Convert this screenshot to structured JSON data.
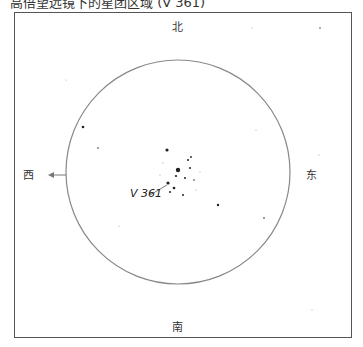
{
  "caption": {
    "text": "高倍望远镜下的星团区域 (V 361)",
    "visible": "partially cut off at top edge"
  },
  "chart": {
    "directions": {
      "north": "北",
      "south": "南",
      "east": "东",
      "west": "西"
    },
    "target_label": "V 361",
    "field_circle": {
      "cx": 178,
      "cy": 172,
      "r": 112,
      "color": "#888888"
    },
    "arrow_direction": "west",
    "colors": {
      "frame": "#555555",
      "star": "#222222",
      "text": "#333333"
    },
    "stars": [
      {
        "x": 167,
        "y": 150,
        "r": 1.6
      },
      {
        "x": 178,
        "y": 170,
        "r": 2.2
      },
      {
        "x": 168,
        "y": 183,
        "r": 1.6
      },
      {
        "x": 174,
        "y": 188,
        "r": 1.3
      },
      {
        "x": 185,
        "y": 178,
        "r": 1.0
      },
      {
        "x": 190,
        "y": 168,
        "r": 1.0
      },
      {
        "x": 188,
        "y": 160,
        "r": 1.0
      },
      {
        "x": 191,
        "y": 157,
        "r": 0.9
      },
      {
        "x": 183,
        "y": 195,
        "r": 1.0
      },
      {
        "x": 170,
        "y": 192,
        "r": 1.0
      },
      {
        "x": 194,
        "y": 180,
        "r": 0.8
      },
      {
        "x": 176,
        "y": 176,
        "r": 1.1
      },
      {
        "x": 160,
        "y": 175,
        "r": 0.6
      },
      {
        "x": 200,
        "y": 172,
        "r": 0.6
      },
      {
        "x": 163,
        "y": 163,
        "r": 0.6
      },
      {
        "x": 196,
        "y": 190,
        "r": 0.6
      },
      {
        "x": 83,
        "y": 127,
        "r": 1.3
      },
      {
        "x": 98,
        "y": 148,
        "r": 0.8
      },
      {
        "x": 218,
        "y": 205,
        "r": 1.2
      },
      {
        "x": 264,
        "y": 218,
        "r": 0.8
      },
      {
        "x": 119,
        "y": 226,
        "r": 0.6
      },
      {
        "x": 319,
        "y": 155,
        "r": 0.6
      },
      {
        "x": 252,
        "y": 28,
        "r": 0.6
      },
      {
        "x": 320,
        "y": 28,
        "r": 0.7
      },
      {
        "x": 312,
        "y": 310,
        "r": 0.5
      },
      {
        "x": 66,
        "y": 80,
        "r": 0.5
      },
      {
        "x": 256,
        "y": 130,
        "r": 0.5
      }
    ]
  }
}
